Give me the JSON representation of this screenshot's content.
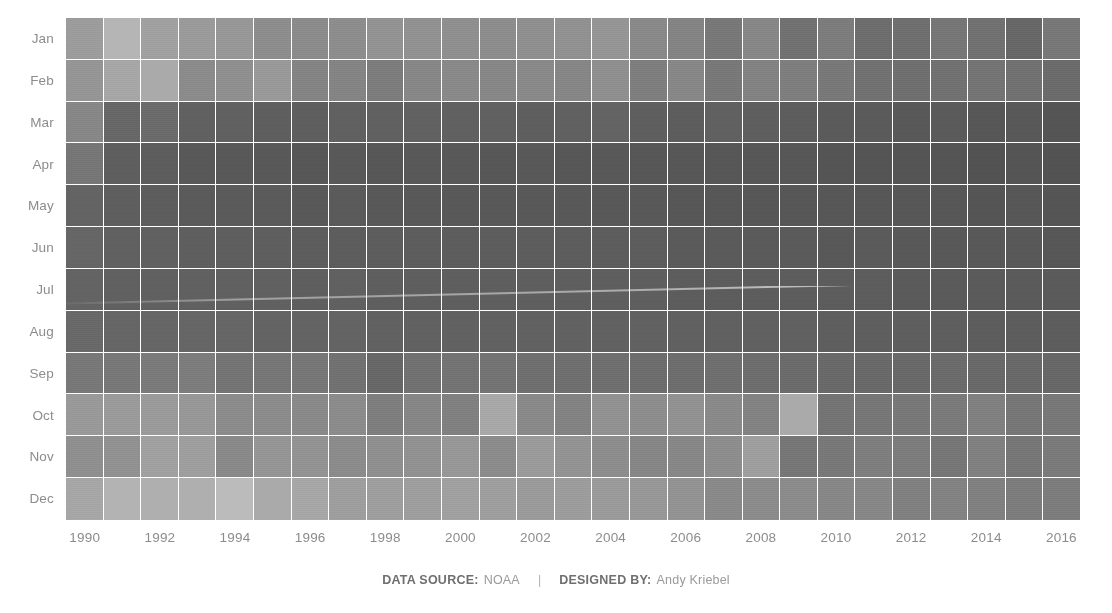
{
  "chart_data": {
    "type": "heatmap",
    "title": "",
    "xlabel": "",
    "ylabel": "",
    "grid": false,
    "legend_position": "none",
    "colorscale": {
      "name": "grayscale-sequential",
      "low_color": "#e8e8e8",
      "high_color": "#3a3a3a",
      "note": "darker = higher value"
    },
    "x": [
      1990,
      1991,
      1992,
      1993,
      1994,
      1995,
      1996,
      1997,
      1998,
      1999,
      2000,
      2001,
      2002,
      2003,
      2004,
      2005,
      2006,
      2007,
      2008,
      2009,
      2010,
      2011,
      2012,
      2013,
      2014,
      2015,
      2016
    ],
    "x_tick_labels": [
      "1990",
      "",
      "1992",
      "",
      "1994",
      "",
      "1996",
      "",
      "1998",
      "",
      "2000",
      "",
      "2002",
      "",
      "2004",
      "",
      "2006",
      "",
      "2008",
      "",
      "2010",
      "",
      "2012",
      "",
      "2014",
      "",
      "2016"
    ],
    "y": [
      "Jan",
      "Feb",
      "Mar",
      "Apr",
      "May",
      "Jun",
      "Jul",
      "Aug",
      "Sep",
      "Oct",
      "Nov",
      "Dec"
    ],
    "z_range": [
      0,
      100
    ],
    "z": [
      [
        43,
        30,
        41,
        44,
        46,
        51,
        52,
        51,
        48,
        49,
        50,
        51,
        50,
        49,
        47,
        53,
        56,
        62,
        54,
        66,
        60,
        68,
        67,
        63,
        66,
        71,
        62
      ],
      [
        47,
        38,
        36,
        52,
        50,
        45,
        56,
        56,
        60,
        54,
        53,
        54,
        53,
        55,
        50,
        59,
        54,
        62,
        57,
        59,
        62,
        66,
        67,
        66,
        64,
        66,
        69
      ],
      [
        54,
        71,
        69,
        75,
        75,
        76,
        76,
        75,
        75,
        74,
        75,
        75,
        76,
        75,
        73,
        76,
        77,
        75,
        76,
        77,
        78,
        78,
        79,
        78,
        80,
        79,
        81
      ],
      [
        63,
        76,
        77,
        79,
        79,
        79,
        80,
        79,
        80,
        79,
        79,
        80,
        79,
        80,
        79,
        80,
        80,
        80,
        80,
        80,
        81,
        81,
        81,
        81,
        82,
        81,
        82
      ],
      [
        73,
        76,
        77,
        78,
        78,
        78,
        79,
        78,
        79,
        79,
        79,
        79,
        79,
        79,
        79,
        79,
        80,
        80,
        80,
        80,
        80,
        80,
        80,
        80,
        81,
        80,
        81
      ],
      [
        72,
        75,
        75,
        76,
        76,
        76,
        77,
        77,
        77,
        77,
        77,
        77,
        77,
        77,
        77,
        77,
        78,
        78,
        78,
        78,
        79,
        78,
        79,
        79,
        79,
        79,
        80
      ],
      [
        73,
        75,
        75,
        75,
        75,
        75,
        76,
        75,
        76,
        76,
        76,
        76,
        76,
        76,
        76,
        76,
        77,
        77,
        77,
        77,
        77,
        77,
        78,
        78,
        78,
        78,
        78
      ],
      [
        70,
        72,
        72,
        72,
        72,
        73,
        73,
        73,
        74,
        74,
        74,
        74,
        74,
        74,
        74,
        74,
        75,
        75,
        75,
        75,
        76,
        76,
        76,
        76,
        77,
        77,
        77
      ],
      [
        62,
        62,
        61,
        60,
        64,
        63,
        63,
        66,
        71,
        66,
        65,
        65,
        67,
        67,
        67,
        68,
        68,
        67,
        68,
        69,
        70,
        70,
        70,
        69,
        70,
        70,
        71
      ],
      [
        45,
        44,
        44,
        46,
        52,
        52,
        53,
        52,
        59,
        55,
        58,
        37,
        53,
        57,
        49,
        51,
        49,
        53,
        57,
        36,
        64,
        63,
        62,
        61,
        58,
        63,
        62
      ],
      [
        50,
        49,
        41,
        42,
        53,
        47,
        48,
        52,
        50,
        49,
        46,
        52,
        44,
        48,
        51,
        55,
        54,
        51,
        42,
        63,
        62,
        59,
        60,
        63,
        58,
        63,
        61
      ],
      [
        38,
        31,
        33,
        33,
        27,
        36,
        38,
        42,
        42,
        42,
        41,
        42,
        44,
        43,
        44,
        46,
        48,
        53,
        52,
        52,
        54,
        54,
        58,
        57,
        58,
        60,
        60
      ]
    ]
  },
  "axes": {
    "months": [
      "Jan",
      "Feb",
      "Mar",
      "Apr",
      "May",
      "Jun",
      "Jul",
      "Aug",
      "Sep",
      "Oct",
      "Nov",
      "Dec"
    ],
    "year_labels": [
      "1990",
      "",
      "1992",
      "",
      "1994",
      "",
      "1996",
      "",
      "1998",
      "",
      "2000",
      "",
      "2002",
      "",
      "2004",
      "",
      "2006",
      "",
      "2008",
      "",
      "2010",
      "",
      "2012",
      "",
      "2014",
      "",
      "2016"
    ]
  },
  "footer": {
    "data_source_key": "DATA SOURCE:",
    "data_source_value": "NOAA",
    "separator": "|",
    "designer_key": "DESIGNED BY:",
    "designer_value": "Andy Kriebel"
  }
}
